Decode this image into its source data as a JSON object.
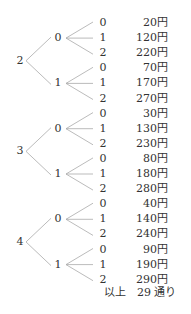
{
  "tree": [
    {
      "root": "2",
      "branches": [
        {
          "label": "0",
          "leaves": [
            {
              "digit": "0",
              "price": "20円"
            },
            {
              "digit": "1",
              "price": "120円"
            },
            {
              "digit": "2",
              "price": "220円"
            }
          ]
        },
        {
          "label": "1",
          "leaves": [
            {
              "digit": "0",
              "price": "70円"
            },
            {
              "digit": "1",
              "price": "170円"
            },
            {
              "digit": "2",
              "price": "270円"
            }
          ]
        }
      ]
    },
    {
      "root": "3",
      "branches": [
        {
          "label": "0",
          "leaves": [
            {
              "digit": "0",
              "price": "30円"
            },
            {
              "digit": "1",
              "price": "130円"
            },
            {
              "digit": "2",
              "price": "230円"
            }
          ]
        },
        {
          "label": "1",
          "leaves": [
            {
              "digit": "0",
              "price": "80円"
            },
            {
              "digit": "1",
              "price": "180円"
            },
            {
              "digit": "2",
              "price": "280円"
            }
          ]
        }
      ]
    },
    {
      "root": "4",
      "branches": [
        {
          "label": "0",
          "leaves": [
            {
              "digit": "0",
              "price": "40円"
            },
            {
              "digit": "1",
              "price": "140円"
            },
            {
              "digit": "2",
              "price": "240円"
            }
          ]
        },
        {
          "label": "1",
          "leaves": [
            {
              "digit": "0",
              "price": "90円"
            },
            {
              "digit": "1",
              "price": "190円"
            },
            {
              "digit": "2",
              "price": "290円"
            }
          ]
        }
      ]
    }
  ],
  "total_label": "以上　29 通り",
  "line_color": "#aaaaaa"
}
